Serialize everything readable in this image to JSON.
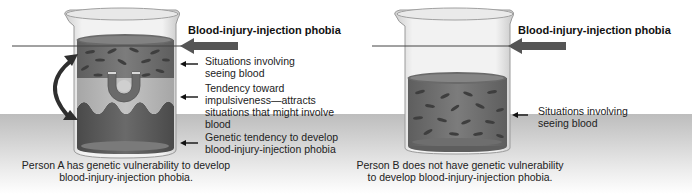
{
  "panels": [
    {
      "id": "person-a",
      "title": "Blood-injury-injection phobia",
      "labels": [
        "Situations involving\nseeing blood",
        "Tendency toward\nimpulsiveness—attracts\nsituations that might involve\nblood",
        "Genetic tendency to develop\nblood-injury-injection phobia"
      ],
      "caption_line1": "Person A has genetic vulnerability to develop",
      "caption_line2": "blood-injury-injection phobia."
    },
    {
      "id": "person-b",
      "title": "Blood-injury-injection phobia",
      "labels": [
        "Situations involving\nseeing blood"
      ],
      "caption_line1": "Person B does not have genetic vulnerability",
      "caption_line2": "to develop blood-injury-injection phobia."
    }
  ],
  "a": {
    "title": "Blood-injury-injection phobia",
    "label1_l1": "Situations involving",
    "label1_l2": "seeing blood",
    "label2_l1": "Tendency toward",
    "label2_l2": "impulsiveness—attracts",
    "label2_l3": "situations that might involve",
    "label2_l4": "blood",
    "label3_l1": "Genetic tendency to develop",
    "label3_l2": "blood-injury-injection phobia",
    "caption_l1": "Person A has genetic vulnerability to develop",
    "caption_l2": "blood-injury-injection phobia."
  },
  "b": {
    "title": "Blood-injury-injection phobia",
    "label1_l1": "Situations involving",
    "label1_l2": "seeing blood",
    "caption_l1": "Person B does not have genetic vulnerability",
    "caption_l2": "to develop blood-injury-injection phobia."
  },
  "icons": {
    "beaker": "beaker-icon",
    "magnet": "magnet-icon",
    "curved_double_arrow": "curved-double-arrow-icon",
    "pointer_arrow": "left-arrow-icon",
    "threshold_arrow": "thick-left-arrow-icon"
  },
  "colors": {
    "liquid_dark": "#5a5a5a",
    "liquid_mid": "#7a7a7a",
    "liquid_light": "#b8b8b8",
    "genetic_layer": "#505050",
    "floor": "#c8c8c8"
  }
}
